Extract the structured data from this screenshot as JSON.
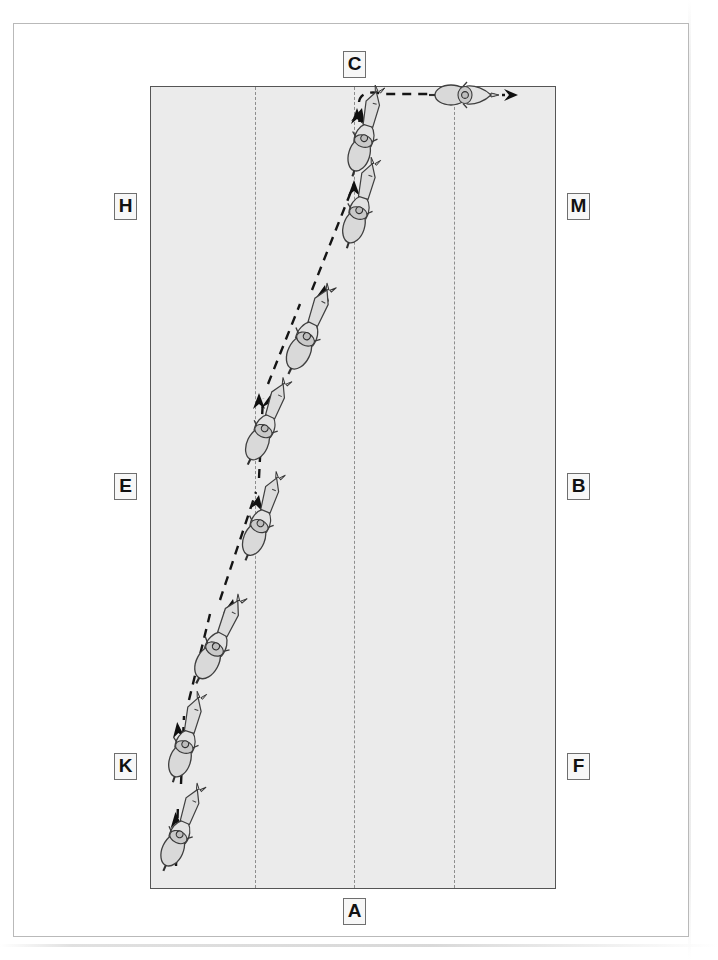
{
  "document": {
    "type": "dressage-arena-diagram",
    "description": "20x60 m dressage arena seen from above with a horse and rider shown in successive positions along a movement.",
    "arena": {
      "fill_color": "#ebebeb",
      "border_color": "#555555",
      "inner_guide_lines": 3,
      "inner_guide_style": "dashed"
    },
    "letters": [
      {
        "id": "C",
        "label": "C",
        "side": "top",
        "x": 342,
        "y": 50
      },
      {
        "id": "H",
        "label": "H",
        "side": "left",
        "x": 113,
        "y": 192
      },
      {
        "id": "M",
        "label": "M",
        "side": "right",
        "x": 566,
        "y": 192
      },
      {
        "id": "E",
        "label": "E",
        "side": "left",
        "x": 113,
        "y": 472
      },
      {
        "id": "B",
        "label": "B",
        "side": "right",
        "x": 566,
        "y": 472
      },
      {
        "id": "K",
        "label": "K",
        "side": "left",
        "x": 113,
        "y": 752
      },
      {
        "id": "F",
        "label": "F",
        "side": "right",
        "x": 566,
        "y": 752
      },
      {
        "id": "A",
        "label": "A",
        "side": "bottom",
        "x": 342,
        "y": 897
      }
    ],
    "track": {
      "color": "#151515",
      "style": "dashed",
      "direction": "from A/K upward on the diagonal, then right turn at C toward M",
      "arrow_count": 9
    },
    "horses": [
      {
        "index": 1,
        "x": 176,
        "y": 830,
        "angle": 24,
        "note": "start near A, tracking left"
      },
      {
        "index": 2,
        "x": 183,
        "y": 740,
        "angle": 18,
        "note": "at K"
      },
      {
        "index": 3,
        "x": 212,
        "y": 643,
        "angle": 28,
        "note": "on diagonal"
      },
      {
        "index": 4,
        "x": 258,
        "y": 519,
        "angle": 22,
        "note": "at E level"
      },
      {
        "index": 5,
        "x": 262,
        "y": 424,
        "angle": 25,
        "note": "on diagonal"
      },
      {
        "index": 6,
        "x": 303,
        "y": 333,
        "angle": 26,
        "note": "mid diagonal"
      },
      {
        "index": 7,
        "x": 356,
        "y": 207,
        "angle": 18,
        "note": "approaching centre line"
      },
      {
        "index": 8,
        "x": 361,
        "y": 135,
        "angle": 17,
        "note": "before C"
      },
      {
        "index": 9,
        "x": 459,
        "y": 99,
        "angle": 90,
        "note": "turned right at C heading toward M"
      }
    ],
    "colors": {
      "arena_fill": "#ebebeb",
      "arena_border": "#555555",
      "track": "#151515",
      "letter_text": "#111111",
      "letter_box_border": "#6f6f6f",
      "page_frame": "#b9b9b9",
      "horse_body": "#d8d8d8",
      "horse_outline": "#3a3a3a"
    }
  }
}
